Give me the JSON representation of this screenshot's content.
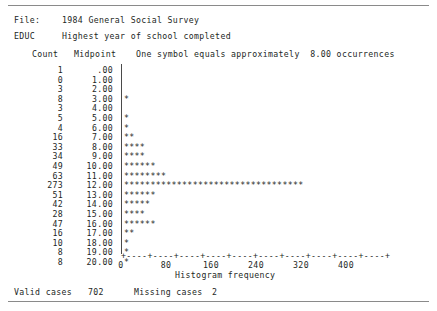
{
  "header": {
    "file_label": "File:",
    "file_value": "1984 General Social Survey",
    "variable_label": "EDUC",
    "variable_description": "Highest year of school completed"
  },
  "columns": {
    "count": "Count",
    "midpoint": "Midpoint",
    "legend": "One symbol equals approximately  8.00 occurrences"
  },
  "axis": {
    "line": "+----+----+----+----+----+----+----+----+----+----+",
    "title": "Histogram frequency",
    "ticks": [
      {
        "label": "0",
        "x": 121
      },
      {
        "label": "80",
        "x": 166
      },
      {
        "label": "160",
        "x": 211
      },
      {
        "label": "240",
        "x": 256
      },
      {
        "label": "320",
        "x": 301
      },
      {
        "label": "400",
        "x": 346
      }
    ]
  },
  "footer": {
    "valid_label": "Valid cases",
    "valid_value": "702",
    "missing_label": "Missing cases",
    "missing_value": "2"
  },
  "chart_data": {
    "type": "bar",
    "orientation": "horizontal",
    "title": "EDUC  Highest year of school completed",
    "subtitle": "1984 General Social Survey",
    "xlabel": "Histogram frequency",
    "ylabel": "Midpoint",
    "xlim": [
      0,
      400
    ],
    "xticks": [
      0,
      80,
      160,
      240,
      320,
      400
    ],
    "grid": false,
    "legend": "One symbol equals approximately 8.00 occurrences",
    "symbol_scale": 8.0,
    "valid_cases": 702,
    "missing_cases": 2,
    "categories": [
      "0.00",
      "1.00",
      "2.00",
      "3.00",
      "4.00",
      "5.00",
      "6.00",
      "7.00",
      "8.00",
      "9.00",
      "10.00",
      "11.00",
      "12.00",
      "13.00",
      "14.00",
      "15.00",
      "16.00",
      "17.00",
      "18.00",
      "19.00",
      "20.00"
    ],
    "values": [
      1,
      0,
      3,
      8,
      3,
      5,
      4,
      16,
      33,
      34,
      49,
      63,
      273,
      51,
      42,
      28,
      47,
      16,
      10,
      8,
      8
    ],
    "rows": [
      {
        "count": "1",
        "midpoint": ".00",
        "bar": ""
      },
      {
        "count": "0",
        "midpoint": "1.00",
        "bar": ""
      },
      {
        "count": "3",
        "midpoint": "2.00",
        "bar": ""
      },
      {
        "count": "8",
        "midpoint": "3.00",
        "bar": "*"
      },
      {
        "count": "3",
        "midpoint": "4.00",
        "bar": ""
      },
      {
        "count": "5",
        "midpoint": "5.00",
        "bar": "*"
      },
      {
        "count": "4",
        "midpoint": "6.00",
        "bar": "*"
      },
      {
        "count": "16",
        "midpoint": "7.00",
        "bar": "**"
      },
      {
        "count": "33",
        "midpoint": "8.00",
        "bar": "****"
      },
      {
        "count": "34",
        "midpoint": "9.00",
        "bar": "****"
      },
      {
        "count": "49",
        "midpoint": "10.00",
        "bar": "******"
      },
      {
        "count": "63",
        "midpoint": "11.00",
        "bar": "********"
      },
      {
        "count": "273",
        "midpoint": "12.00",
        "bar": "**********************************"
      },
      {
        "count": "51",
        "midpoint": "13.00",
        "bar": "******"
      },
      {
        "count": "42",
        "midpoint": "14.00",
        "bar": "*****"
      },
      {
        "count": "28",
        "midpoint": "15.00",
        "bar": "****"
      },
      {
        "count": "47",
        "midpoint": "16.00",
        "bar": "******"
      },
      {
        "count": "16",
        "midpoint": "17.00",
        "bar": "**"
      },
      {
        "count": "10",
        "midpoint": "18.00",
        "bar": "*"
      },
      {
        "count": "8",
        "midpoint": "19.00",
        "bar": "*"
      },
      {
        "count": "8",
        "midpoint": "20.00",
        "bar": "*"
      }
    ]
  }
}
